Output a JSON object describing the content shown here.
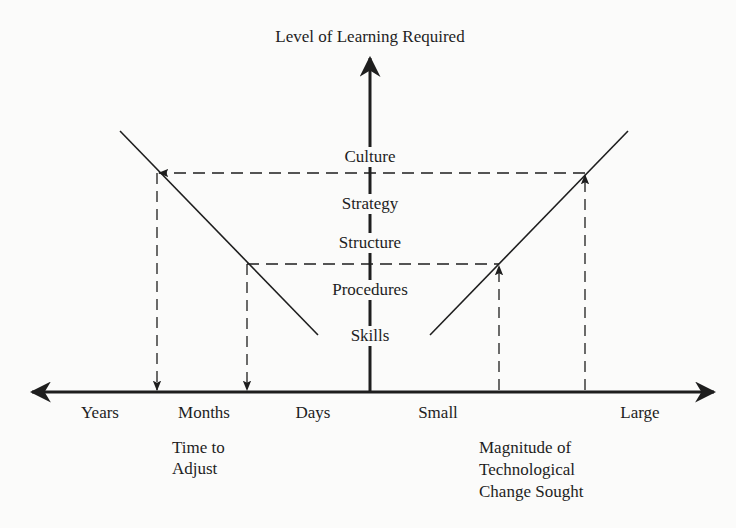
{
  "diagram": {
    "vertical_axis": {
      "title": "Level of Learning Required",
      "levels": [
        {
          "label": "Culture",
          "x": 370,
          "y": 157
        },
        {
          "label": "Strategy",
          "x": 370,
          "y": 204
        },
        {
          "label": "Structure",
          "x": 370,
          "y": 243
        },
        {
          "label": "Procedures",
          "x": 370,
          "y": 290
        },
        {
          "label": "Skills",
          "x": 370,
          "y": 336
        }
      ]
    },
    "horizontal_axis": {
      "left_ticks": [
        "Years",
        "Months",
        "Days"
      ],
      "right_ticks": [
        "Small",
        "Large"
      ],
      "left_title_line1": "Time to",
      "left_title_line2": "Adjust",
      "right_title_line1": "Magnitude of",
      "right_title_line2": "Technological",
      "right_title_line3": "Change Sought"
    },
    "colors": {
      "ink": "#1e1e1e",
      "background": "#fbfbfa"
    }
  }
}
